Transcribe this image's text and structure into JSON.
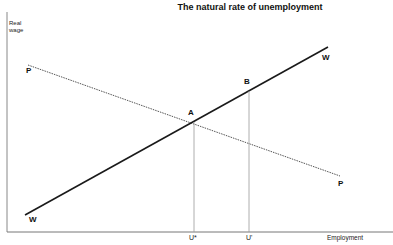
{
  "title": "The natural rate of unemployment",
  "y_axis_label_line1": "Real",
  "y_axis_label_line2": "wage",
  "x_axis_label": "Employment",
  "curves": {
    "wage_setting": {
      "label_start": "W",
      "label_end": "W",
      "style": "solid"
    },
    "price_setting": {
      "label_start": "P",
      "label_end": "P",
      "style": "dotted"
    }
  },
  "points": {
    "A": "A",
    "B": "B"
  },
  "x_ticks": {
    "u_star": "U*",
    "u_prime": "U'"
  },
  "colors": {
    "line": "#1a1a1a",
    "guide": "#888888",
    "axis": "#777777"
  }
}
